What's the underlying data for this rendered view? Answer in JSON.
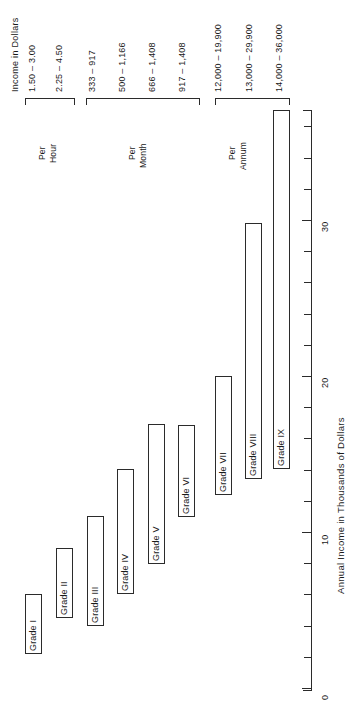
{
  "header": {
    "title": "Income in Dollars"
  },
  "chart_data": {
    "type": "bar",
    "title": "Income in Dollars",
    "xlabel": "",
    "ylabel": "Annual Income in Thousands of Dollars",
    "orientation": "vertical-floating-range",
    "ylim": [
      0,
      36
    ],
    "tick_labels": [
      "0",
      "10",
      "20",
      "30"
    ],
    "tick_values": [
      0,
      10,
      20,
      30
    ],
    "minor_tick_step": 2,
    "grid": false,
    "legend": "none",
    "categories": [
      "Grade I",
      "Grade II",
      "Grade III",
      "Grade IV",
      "Grade V",
      "Grade VI",
      "Grade VII",
      "Grade VIII",
      "Grade IX"
    ],
    "value_low": [
      2.3,
      4.5,
      4.0,
      6.0,
      8.0,
      11.0,
      12.4,
      13.4,
      14.0
    ],
    "value_high": [
      6.0,
      9.0,
      11.0,
      14.0,
      17.0,
      16.9,
      20.0,
      30.0,
      36.0
    ],
    "units": "thousands of dollars per annum",
    "groups": [
      {
        "label_line1": "Per",
        "label_line2": "Hour",
        "members": [
          "Grade I",
          "Grade II"
        ]
      },
      {
        "label_line1": "Per",
        "label_line2": "Month",
        "members": [
          "Grade III",
          "Grade IV",
          "Grade V",
          "Grade VI"
        ]
      },
      {
        "label_line1": "Per",
        "label_line2": "Annum",
        "members": [
          "Grade VII",
          "Grade VIII",
          "Grade IX"
        ]
      }
    ],
    "income_in_dollars": [
      "1.50 – 3.00",
      "2.25 – 4.50",
      "333 – 917",
      "500 – 1,166",
      "666 – 1,408",
      "917 – 1,408",
      "12,000 – 19,900",
      "13,000 – 29,900",
      "14,000 – 36,000"
    ]
  },
  "bars": [
    {
      "label": "Grade I",
      "income": "1.50 – 3.00"
    },
    {
      "label": "Grade II",
      "income": "2.25 – 4.50"
    },
    {
      "label": "Grade III",
      "income": "333 – 917"
    },
    {
      "label": "Grade IV",
      "income": "500 – 1,166"
    },
    {
      "label": "Grade V",
      "income": "666 – 1,408"
    },
    {
      "label": "Grade VI",
      "income": "917 – 1,408"
    },
    {
      "label": "Grade VII",
      "income": "12,000 – 19,900"
    },
    {
      "label": "Grade VIII",
      "income": "13,000 – 29,900"
    },
    {
      "label": "Grade IX",
      "income": "14,000 – 36,000"
    }
  ],
  "groups": [
    {
      "line1": "Per",
      "line2": "Hour"
    },
    {
      "line1": "Per",
      "line2": "Month"
    },
    {
      "line1": "Per",
      "line2": "Annum"
    }
  ],
  "axis": {
    "title": "Annual Income in Thousands of Dollars",
    "labels": [
      "0",
      "10",
      "20",
      "30"
    ]
  },
  "colors": {
    "ink": "#2b2b2b",
    "paper": "#ffffff"
  }
}
